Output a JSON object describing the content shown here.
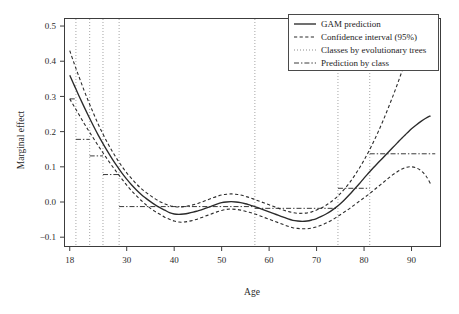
{
  "chart_data": {
    "type": "line",
    "title": "",
    "xlabel": "Age",
    "ylabel": "Marginal effect",
    "xlim": [
      17.0,
      96.0
    ],
    "ylim": [
      -0.125,
      0.52
    ],
    "xticks": [
      18,
      30,
      40,
      50,
      60,
      70,
      80,
      90
    ],
    "xticklabels": [
      "18",
      "30",
      "40",
      "50",
      "60",
      "70",
      "80",
      "90"
    ],
    "yticks": [
      -0.1,
      0.0,
      0.1,
      0.2,
      0.3,
      0.4,
      0.5
    ],
    "yticklabels": [
      "-0.1",
      "0.0",
      "0.1",
      "0.2",
      "0.3",
      "0.4",
      "0.5"
    ],
    "grid": false,
    "legend_position": "top-right",
    "legend": [
      {
        "label": "GAM prediction",
        "style": "solid"
      },
      {
        "label": "Confidence interval (95%)",
        "style": "dashed"
      },
      {
        "label": "Classes by evolutionary trees",
        "style": "dotted"
      },
      {
        "label": "Prediction by class",
        "style": "dashdot"
      }
    ],
    "series": [
      {
        "name": "GAM prediction",
        "style": "solid",
        "x": [
          18,
          19,
          20,
          21,
          22,
          23,
          24,
          25,
          26,
          27,
          28,
          29,
          30,
          31,
          32,
          33,
          34,
          35,
          36,
          37,
          38,
          39,
          40,
          41,
          42,
          43,
          44,
          45,
          46,
          47,
          48,
          49,
          50,
          51,
          52,
          53,
          54,
          55,
          56,
          57,
          58,
          59,
          60,
          61,
          62,
          63,
          64,
          65,
          66,
          67,
          68,
          69,
          70,
          71,
          72,
          73,
          74,
          75,
          76,
          77,
          78,
          79,
          80,
          81,
          82,
          83,
          84,
          85,
          86,
          87,
          88,
          89,
          90,
          91,
          92,
          93,
          94
        ],
        "y": [
          0.36,
          0.33,
          0.3,
          0.271,
          0.243,
          0.216,
          0.19,
          0.166,
          0.143,
          0.121,
          0.101,
          0.082,
          0.065,
          0.049,
          0.035,
          0.022,
          0.011,
          0.001,
          -0.008,
          -0.016,
          -0.023,
          -0.03,
          -0.034,
          -0.035,
          -0.034,
          -0.032,
          -0.029,
          -0.025,
          -0.021,
          -0.016,
          -0.011,
          -0.006,
          -0.002,
          0.0,
          0.001,
          0.0,
          -0.002,
          -0.005,
          -0.009,
          -0.013,
          -0.018,
          -0.023,
          -0.028,
          -0.033,
          -0.038,
          -0.043,
          -0.048,
          -0.052,
          -0.054,
          -0.055,
          -0.054,
          -0.051,
          -0.047,
          -0.041,
          -0.034,
          -0.026,
          -0.016,
          -0.005,
          0.008,
          0.022,
          0.037,
          0.052,
          0.068,
          0.083,
          0.098,
          0.112,
          0.126,
          0.14,
          0.154,
          0.168,
          0.182,
          0.195,
          0.208,
          0.219,
          0.229,
          0.238,
          0.245
        ]
      },
      {
        "name": "Confidence interval upper (95%)",
        "style": "dashed",
        "x": [
          18,
          19,
          20,
          21,
          22,
          23,
          24,
          25,
          26,
          27,
          28,
          29,
          30,
          31,
          32,
          33,
          34,
          35,
          36,
          37,
          38,
          39,
          40,
          41,
          42,
          43,
          44,
          45,
          46,
          47,
          48,
          49,
          50,
          51,
          52,
          53,
          54,
          55,
          56,
          57,
          58,
          59,
          60,
          61,
          62,
          63,
          64,
          65,
          66,
          67,
          68,
          69,
          70,
          71,
          72,
          73,
          74,
          75,
          76,
          77,
          78,
          79,
          80,
          81,
          82,
          83,
          84,
          85,
          86,
          87,
          88,
          89,
          90,
          91,
          92
        ],
        "y": [
          0.43,
          0.391,
          0.354,
          0.318,
          0.284,
          0.252,
          0.221,
          0.193,
          0.167,
          0.143,
          0.121,
          0.101,
          0.083,
          0.067,
          0.052,
          0.039,
          0.028,
          0.018,
          0.009,
          0.001,
          -0.005,
          -0.01,
          -0.013,
          -0.014,
          -0.013,
          -0.011,
          -0.008,
          -0.004,
          0.001,
          0.006,
          0.011,
          0.016,
          0.02,
          0.022,
          0.023,
          0.022,
          0.02,
          0.016,
          0.012,
          0.007,
          0.002,
          -0.003,
          -0.008,
          -0.013,
          -0.018,
          -0.023,
          -0.027,
          -0.03,
          -0.032,
          -0.032,
          -0.031,
          -0.028,
          -0.023,
          -0.017,
          -0.009,
          0.0,
          0.011,
          0.024,
          0.039,
          0.056,
          0.075,
          0.096,
          0.119,
          0.144,
          0.171,
          0.2,
          0.231,
          0.264,
          0.298,
          0.334,
          0.372,
          0.41,
          0.45,
          0.492,
          0.536
        ]
      },
      {
        "name": "Confidence interval lower (95%)",
        "style": "dashed",
        "x": [
          18,
          19,
          20,
          21,
          22,
          23,
          24,
          25,
          26,
          27,
          28,
          29,
          30,
          31,
          32,
          33,
          34,
          35,
          36,
          37,
          38,
          39,
          40,
          41,
          42,
          43,
          44,
          45,
          46,
          47,
          48,
          49,
          50,
          51,
          52,
          53,
          54,
          55,
          56,
          57,
          58,
          59,
          60,
          61,
          62,
          63,
          64,
          65,
          66,
          67,
          68,
          69,
          70,
          71,
          72,
          73,
          74,
          75,
          76,
          77,
          78,
          79,
          80,
          81,
          82,
          83,
          84,
          85,
          86,
          87,
          88,
          89,
          90,
          91,
          92,
          93,
          94
        ],
        "y": [
          0.293,
          0.27,
          0.247,
          0.224,
          0.202,
          0.181,
          0.16,
          0.14,
          0.12,
          0.101,
          0.083,
          0.065,
          0.048,
          0.032,
          0.018,
          0.005,
          -0.007,
          -0.018,
          -0.027,
          -0.035,
          -0.043,
          -0.049,
          -0.054,
          -0.057,
          -0.057,
          -0.055,
          -0.052,
          -0.048,
          -0.043,
          -0.038,
          -0.033,
          -0.028,
          -0.024,
          -0.021,
          -0.02,
          -0.021,
          -0.023,
          -0.026,
          -0.03,
          -0.034,
          -0.039,
          -0.044,
          -0.049,
          -0.054,
          -0.059,
          -0.064,
          -0.069,
          -0.073,
          -0.075,
          -0.076,
          -0.076,
          -0.074,
          -0.071,
          -0.066,
          -0.06,
          -0.053,
          -0.045,
          -0.036,
          -0.027,
          -0.018,
          -0.008,
          0.002,
          0.012,
          0.022,
          0.033,
          0.044,
          0.055,
          0.066,
          0.077,
          0.086,
          0.094,
          0.099,
          0.1,
          0.097,
          0.089,
          0.075,
          0.052
        ]
      },
      {
        "name": "Prediction by class",
        "style": "dashdot",
        "segments": [
          {
            "x_start": 18.0,
            "x_end": 19.3,
            "y": 0.293
          },
          {
            "x_start": 19.3,
            "x_end": 22.2,
            "y": 0.178
          },
          {
            "x_start": 22.2,
            "x_end": 25.0,
            "y": 0.131
          },
          {
            "x_start": 25.0,
            "x_end": 28.4,
            "y": 0.078
          },
          {
            "x_start": 28.4,
            "x_end": 57.0,
            "y": -0.013
          },
          {
            "x_start": 57.0,
            "x_end": 74.5,
            "y": -0.018
          },
          {
            "x_start": 74.5,
            "x_end": 81.2,
            "y": 0.039
          },
          {
            "x_start": 81.2,
            "x_end": 95.0,
            "y": 0.137
          }
        ]
      }
    ],
    "vertical_lines": {
      "name": "Classes by evolutionary trees",
      "style": "dotted",
      "x": [
        19.3,
        22.2,
        25.0,
        28.4,
        57.0,
        74.5,
        81.2
      ]
    }
  }
}
